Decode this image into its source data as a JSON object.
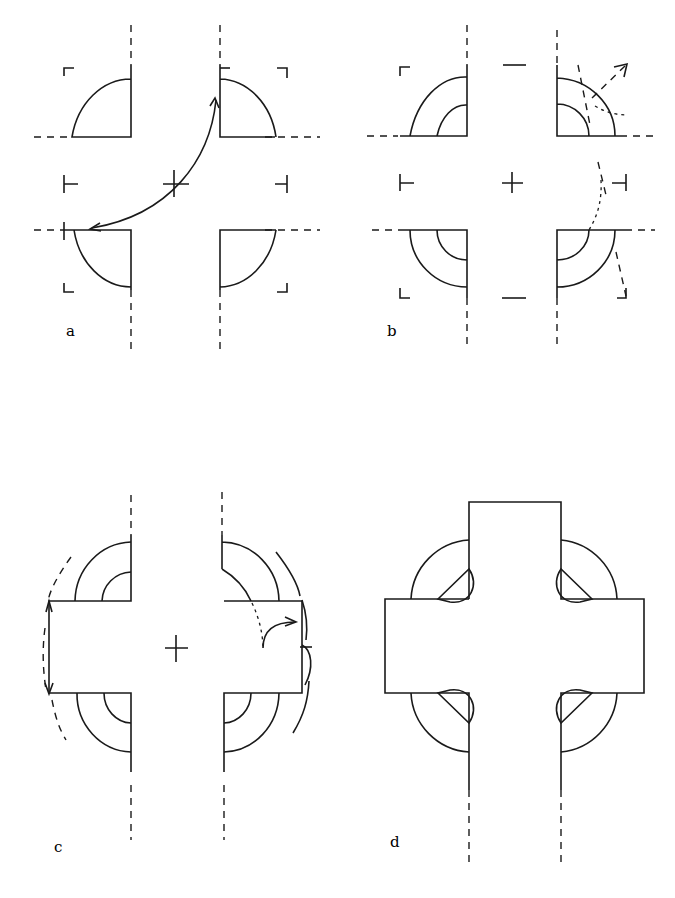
{
  "figure": {
    "panels": [
      {
        "id": "a",
        "label": "a",
        "description": "Four quarter-circle corner pieces with corner bracket marks, center cross, and curved double-headed arrow between top-right and bottom-left pieces"
      },
      {
        "id": "b",
        "label": "b",
        "description": "Corner pieces with inner concentric arcs, dashed rotation arrows on right side, center cross"
      },
      {
        "id": "c",
        "label": "c",
        "description": "Horizontal arm rectangle added with concentric arcs and curved arrows indicating rotation"
      },
      {
        "id": "d",
        "label": "d",
        "description": "Completed ring cross shape with semicircular notches at the four inner corners and dashed shaft lines below"
      }
    ],
    "colors": {
      "stroke": "#1a1a1a",
      "background": "#ffffff"
    }
  }
}
